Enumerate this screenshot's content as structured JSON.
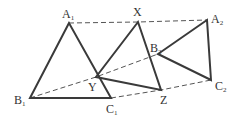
{
  "diagram": {
    "colors": {
      "line": "#3a3a3a",
      "dash": "#555555",
      "text": "#333333",
      "background": "#ffffff"
    },
    "points": {
      "A1": {
        "x": 69,
        "y": 23
      },
      "B1": {
        "x": 30,
        "y": 98
      },
      "C1": {
        "x": 111,
        "y": 98
      },
      "X": {
        "x": 138,
        "y": 22
      },
      "Y": {
        "x": 96,
        "y": 77
      },
      "Z": {
        "x": 161,
        "y": 90
      },
      "A2": {
        "x": 207,
        "y": 20
      },
      "B2": {
        "x": 158,
        "y": 54
      },
      "C2": {
        "x": 211,
        "y": 80
      }
    },
    "triangles": [
      {
        "name": "A1B1C1",
        "vertices": [
          "A1",
          "B1",
          "C1"
        ]
      },
      {
        "name": "XYZ",
        "vertices": [
          "X",
          "Y",
          "Z"
        ]
      },
      {
        "name": "A2B2C2",
        "vertices": [
          "A2",
          "B2",
          "C2"
        ]
      }
    ],
    "dashed_lines": [
      {
        "from": "A1",
        "via": "X",
        "to": "A2"
      },
      {
        "from": "B1",
        "via": "Y",
        "to": "B2"
      },
      {
        "from": "C1",
        "via": "Z",
        "to": "C2"
      }
    ],
    "labels": {
      "A1": {
        "main": "A",
        "sub": "1"
      },
      "B1": {
        "main": "B",
        "sub": "1"
      },
      "C1": {
        "main": "C",
        "sub": "1"
      },
      "X": {
        "main": "X",
        "sub": ""
      },
      "Y": {
        "main": "Y",
        "sub": ""
      },
      "Z": {
        "main": "Z",
        "sub": ""
      },
      "A2": {
        "main": "A",
        "sub": "2"
      },
      "B2": {
        "main": "B",
        "sub": "2"
      },
      "C2": {
        "main": "C",
        "sub": "2"
      }
    }
  }
}
